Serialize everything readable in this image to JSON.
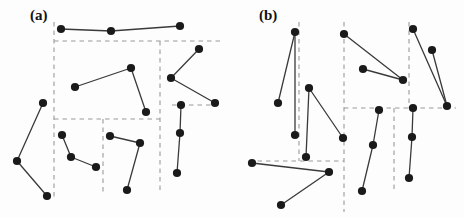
{
  "figure": {
    "background_color": "#fdfdfd",
    "dot_color": "#1a1a1a",
    "edge_color": "#3a3a3a",
    "dashed_color": "#9a9a9a",
    "width": 464,
    "height": 217
  },
  "panels": [
    {
      "id": "panel-a",
      "label": "(a)",
      "label_x": 30,
      "label_y": 8,
      "points": [
        {
          "id": "a1",
          "x": 61,
          "y": 29
        },
        {
          "id": "a2",
          "x": 111,
          "y": 31
        },
        {
          "id": "a3",
          "x": 180,
          "y": 26
        },
        {
          "id": "a4",
          "x": 75,
          "y": 87
        },
        {
          "id": "a5",
          "x": 131,
          "y": 68
        },
        {
          "id": "a6",
          "x": 146,
          "y": 112
        },
        {
          "id": "a7",
          "x": 199,
          "y": 49
        },
        {
          "id": "a8",
          "x": 171,
          "y": 78
        },
        {
          "id": "a9",
          "x": 215,
          "y": 103
        },
        {
          "id": "a10",
          "x": 181,
          "y": 105
        },
        {
          "id": "a11",
          "x": 180,
          "y": 133
        },
        {
          "id": "a12",
          "x": 177,
          "y": 173
        },
        {
          "id": "a13",
          "x": 43,
          "y": 103
        },
        {
          "id": "a14",
          "x": 17,
          "y": 161
        },
        {
          "id": "a15",
          "x": 47,
          "y": 196
        },
        {
          "id": "a16",
          "x": 62,
          "y": 135
        },
        {
          "id": "a17",
          "x": 71,
          "y": 157
        },
        {
          "id": "a18",
          "x": 96,
          "y": 167
        },
        {
          "id": "a19",
          "x": 110,
          "y": 136
        },
        {
          "id": "a20",
          "x": 140,
          "y": 143
        },
        {
          "id": "a21",
          "x": 127,
          "y": 190
        }
      ],
      "edges": [
        [
          "a1",
          "a2"
        ],
        [
          "a2",
          "a3"
        ],
        [
          "a4",
          "a5"
        ],
        [
          "a5",
          "a6"
        ],
        [
          "a7",
          "a8"
        ],
        [
          "a8",
          "a9"
        ],
        [
          "a10",
          "a11"
        ],
        [
          "a11",
          "a12"
        ],
        [
          "a13",
          "a14"
        ],
        [
          "a14",
          "a15"
        ],
        [
          "a16",
          "a17"
        ],
        [
          "a17",
          "a18"
        ],
        [
          "a19",
          "a20"
        ],
        [
          "a20",
          "a21"
        ]
      ],
      "dashed_lines": [
        {
          "id": "a-vline-left",
          "x1": 54,
          "y1": 22,
          "x2": 54,
          "y2": 198
        },
        {
          "id": "a-hline-top",
          "x1": 54,
          "y1": 41,
          "x2": 221,
          "y2": 41
        },
        {
          "id": "a-hline-mid",
          "x1": 54,
          "y1": 119,
          "x2": 160,
          "y2": 119
        },
        {
          "id": "a-vline-mid",
          "x1": 160,
          "y1": 41,
          "x2": 160,
          "y2": 192
        },
        {
          "id": "a-vline-inner",
          "x1": 103,
          "y1": 119,
          "x2": 103,
          "y2": 192
        },
        {
          "id": "a-hline-right",
          "x1": 172,
          "y1": 105,
          "x2": 215,
          "y2": 105
        }
      ]
    },
    {
      "id": "panel-b",
      "label": "(b)",
      "label_x": 259,
      "label_y": 8,
      "points": [
        {
          "id": "b1",
          "x": 295,
          "y": 32
        },
        {
          "id": "b2",
          "x": 278,
          "y": 103
        },
        {
          "id": "b3",
          "x": 295,
          "y": 135
        },
        {
          "id": "b4",
          "x": 309,
          "y": 88
        },
        {
          "id": "b5",
          "x": 306,
          "y": 157
        },
        {
          "id": "b6",
          "x": 343,
          "y": 138
        },
        {
          "id": "b7",
          "x": 252,
          "y": 163
        },
        {
          "id": "b8",
          "x": 329,
          "y": 172
        },
        {
          "id": "b9",
          "x": 281,
          "y": 205
        },
        {
          "id": "b10",
          "x": 344,
          "y": 34
        },
        {
          "id": "b11",
          "x": 363,
          "y": 69
        },
        {
          "id": "b12",
          "x": 403,
          "y": 80
        },
        {
          "id": "b13",
          "x": 413,
          "y": 29
        },
        {
          "id": "b14",
          "x": 432,
          "y": 50
        },
        {
          "id": "b15",
          "x": 447,
          "y": 106
        },
        {
          "id": "b16",
          "x": 413,
          "y": 108
        },
        {
          "id": "b17",
          "x": 412,
          "y": 137
        },
        {
          "id": "b18",
          "x": 409,
          "y": 178
        },
        {
          "id": "b19",
          "x": 379,
          "y": 110
        },
        {
          "id": "b20",
          "x": 373,
          "y": 145
        },
        {
          "id": "b21",
          "x": 362,
          "y": 191
        }
      ],
      "edges": [
        [
          "b1",
          "b2"
        ],
        [
          "b1",
          "b3"
        ],
        [
          "b4",
          "b5"
        ],
        [
          "b4",
          "b6"
        ],
        [
          "b7",
          "b8"
        ],
        [
          "b8",
          "b9"
        ],
        [
          "b10",
          "b12"
        ],
        [
          "b11",
          "b12"
        ],
        [
          "b13",
          "b15"
        ],
        [
          "b14",
          "b15"
        ],
        [
          "b16",
          "b17"
        ],
        [
          "b17",
          "b18"
        ],
        [
          "b19",
          "b20"
        ],
        [
          "b20",
          "b21"
        ]
      ],
      "dashed_lines": [
        {
          "id": "b-vline-1",
          "x1": 299,
          "y1": 22,
          "x2": 299,
          "y2": 161
        },
        {
          "id": "b-vline-2",
          "x1": 344,
          "y1": 22,
          "x2": 344,
          "y2": 212
        },
        {
          "id": "b-vline-3",
          "x1": 409,
          "y1": 22,
          "x2": 409,
          "y2": 108
        },
        {
          "id": "b-vline-4",
          "x1": 394,
          "y1": 108,
          "x2": 394,
          "y2": 190
        },
        {
          "id": "b-hline-1",
          "x1": 249,
          "y1": 161,
          "x2": 344,
          "y2": 161
        },
        {
          "id": "b-hline-2",
          "x1": 344,
          "y1": 108,
          "x2": 456,
          "y2": 108
        }
      ]
    }
  ]
}
